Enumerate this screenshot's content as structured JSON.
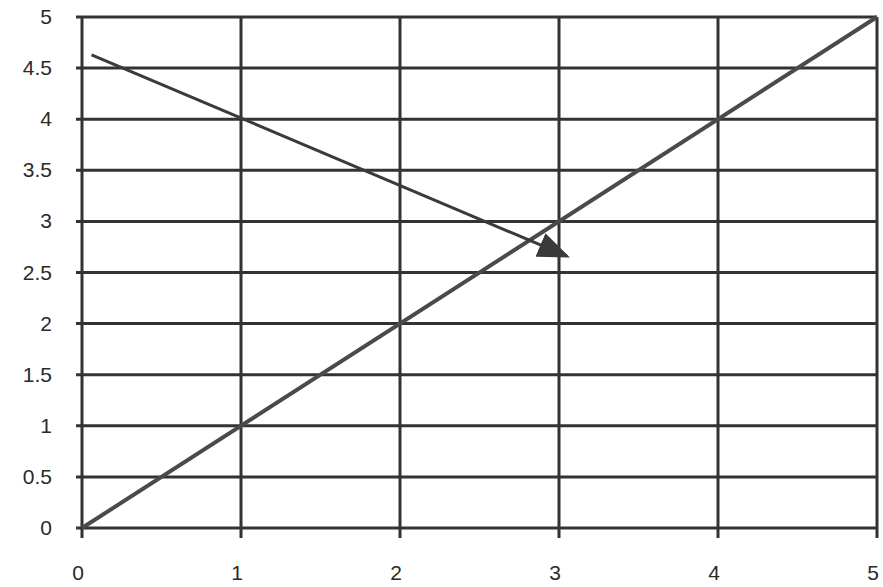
{
  "chart_data": {
    "type": "line",
    "title": "",
    "xlabel": "",
    "ylabel": "",
    "xlim": [
      0,
      5
    ],
    "ylim": [
      0,
      5
    ],
    "grid": true,
    "x_ticks": [
      "0",
      "1",
      "2",
      "3",
      "4",
      "5"
    ],
    "y_ticks": [
      "0",
      "0.5",
      "1",
      "1.5",
      "2",
      "2.5",
      "3",
      "3.5",
      "4",
      "4.5",
      "5"
    ],
    "series": [
      {
        "name": "diagonal",
        "style": "line",
        "color": "#4a4a4a",
        "points": [
          [
            0,
            0
          ],
          [
            5,
            5
          ]
        ]
      },
      {
        "name": "arrow",
        "style": "arrow",
        "color": "#3a3a3a",
        "points": [
          [
            0.06,
            4.63
          ],
          [
            3.05,
            2.66
          ]
        ]
      }
    ]
  },
  "colors": {
    "grid": "#333333",
    "background": "#ffffff",
    "text": "#2a2a2a"
  }
}
